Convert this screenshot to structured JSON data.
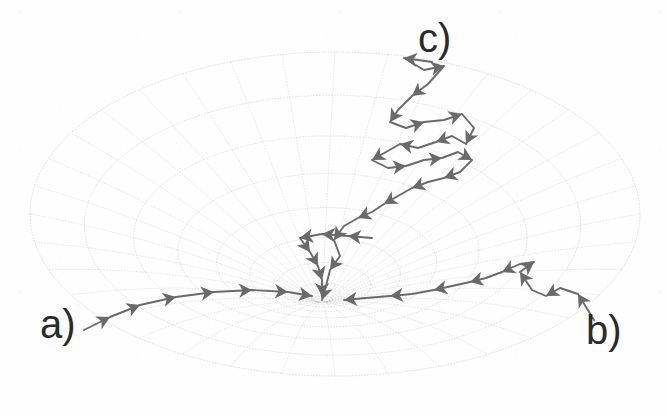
{
  "figure": {
    "background_color": "#ffffff",
    "grid_color": "#b9b9b9",
    "trajectory_color": "#6a6a6a",
    "label_color": "#2b2b2b",
    "width": 667,
    "height": 416
  },
  "labels": [
    {
      "id": "a",
      "text": "a)",
      "x": 40,
      "y": 304,
      "font_size": 40
    },
    {
      "id": "b",
      "text": "b)",
      "x": 586,
      "y": 310,
      "font_size": 40
    },
    {
      "id": "c",
      "text": "c)",
      "x": 418,
      "y": 18,
      "font_size": 40
    }
  ],
  "chart_data": {
    "type": "scatter",
    "xlabel": "",
    "ylabel": "",
    "xlim": [
      0,
      667
    ],
    "ylim": [
      0,
      416
    ],
    "grid": true,
    "legend_position": "none",
    "annotations": [
      "a)",
      "b)",
      "c)"
    ],
    "surface": {
      "description": "dotted curvilinear mesh over an elliptical disc with a singular convergence point (funnel/cusp) near lower-center",
      "ellipse_center_x": 335,
      "ellipse_center_y": 214,
      "ellipse_radius_x": 305,
      "ellipse_radius_y": 162,
      "singularity_x": 322,
      "singularity_y": 302,
      "radial_spokes": 36,
      "concentric_rings": 9,
      "dash_pattern": "1 2"
    },
    "series": [
      {
        "name": "a",
        "label": "a)",
        "color": "#6a6a6a",
        "direction": "left-to-right toward singularity",
        "points": [
          [
            84,
            330
          ],
          [
            110,
            317
          ],
          [
            140,
            305
          ],
          [
            176,
            297
          ],
          [
            214,
            292
          ],
          [
            252,
            290
          ],
          [
            288,
            292
          ],
          [
            312,
            296
          ]
        ],
        "arrow_indices": [
          1,
          2,
          3,
          4,
          5,
          6,
          7
        ]
      },
      {
        "name": "b",
        "label": "b)",
        "color": "#6a6a6a",
        "direction": "right-to-left toward singularity",
        "points": [
          [
            594,
            320
          ],
          [
            578,
            294
          ],
          [
            560,
            288
          ],
          [
            546,
            296
          ],
          [
            532,
            290
          ],
          [
            520,
            272
          ],
          [
            534,
            262
          ],
          [
            520,
            264
          ],
          [
            502,
            272
          ],
          [
            486,
            278
          ],
          [
            470,
            282
          ],
          [
            452,
            286
          ],
          [
            434,
            290
          ],
          [
            412,
            294
          ],
          [
            390,
            296
          ],
          [
            366,
            298
          ],
          [
            344,
            300
          ]
        ],
        "arrow_indices": [
          1,
          3,
          5,
          6,
          8,
          10,
          12,
          14,
          16
        ]
      },
      {
        "name": "c",
        "label": "c)",
        "color": "#6a6a6a",
        "direction": "random-walk from upper region descending to singularity",
        "points": [
          [
            432,
            62
          ],
          [
            404,
            58
          ],
          [
            424,
            70
          ],
          [
            444,
            66
          ],
          [
            428,
            84
          ],
          [
            412,
            96
          ],
          [
            398,
            110
          ],
          [
            390,
            122
          ],
          [
            406,
            128
          ],
          [
            424,
            122
          ],
          [
            444,
            120
          ],
          [
            462,
            114
          ],
          [
            474,
            128
          ],
          [
            466,
            144
          ],
          [
            452,
            136
          ],
          [
            436,
            142
          ],
          [
            418,
            148
          ],
          [
            400,
            144
          ],
          [
            386,
            152
          ],
          [
            372,
            160
          ],
          [
            388,
            168
          ],
          [
            406,
            166
          ],
          [
            424,
            160
          ],
          [
            442,
            158
          ],
          [
            458,
            152
          ],
          [
            472,
            160
          ],
          [
            460,
            172
          ],
          [
            444,
            178
          ],
          [
            428,
            182
          ],
          [
            412,
            188
          ],
          [
            398,
            196
          ],
          [
            384,
            204
          ],
          [
            372,
            212
          ],
          [
            358,
            218
          ],
          [
            344,
            226
          ],
          [
            334,
            240
          ],
          [
            340,
            256
          ],
          [
            330,
            270
          ],
          [
            326,
            286
          ],
          [
            322,
            300
          ]
        ],
        "arrow_indices": [
          1,
          3,
          5,
          7,
          9,
          11,
          13,
          15,
          17,
          19,
          21,
          23,
          25,
          27,
          29,
          31,
          33,
          35,
          37,
          39
        ]
      },
      {
        "name": "c-branch",
        "label": "",
        "color": "#6a6a6a",
        "direction": "left spur of trajectory c toward singularity",
        "points": [
          [
            372,
            238
          ],
          [
            348,
            236
          ],
          [
            322,
            234
          ],
          [
            300,
            238
          ],
          [
            310,
            252
          ],
          [
            318,
            266
          ],
          [
            322,
            280
          ],
          [
            322,
            296
          ]
        ],
        "arrow_indices": [
          1,
          2,
          3,
          4,
          5,
          6,
          7
        ]
      }
    ]
  }
}
